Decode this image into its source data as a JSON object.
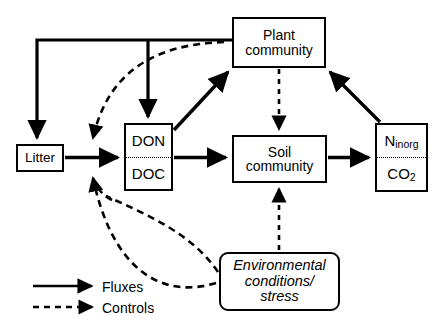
{
  "diagram": {
    "nodes": {
      "litter": {
        "label": "Litter"
      },
      "plant_community": {
        "line1": "Plant",
        "line2": "community"
      },
      "dom": {
        "top": "DON",
        "bottom": "DOC"
      },
      "soil_community": {
        "line1": "Soil",
        "line2": "community"
      },
      "inorganic": {
        "top_main": "N",
        "top_sub": "inorg",
        "bottom_main": "CO",
        "bottom_sub": "2"
      },
      "environment": {
        "line1": "Environmental",
        "line2": "conditions/",
        "line3": "stress"
      }
    },
    "legend": {
      "fluxes_label": "Fluxes",
      "controls_label": "Controls"
    },
    "colors": {
      "stroke": "#000000",
      "background": "#ffffff"
    },
    "edges": [
      {
        "from": "plant_community",
        "to": "litter",
        "type": "flux"
      },
      {
        "from": "plant_community",
        "to": "dom",
        "type": "flux"
      },
      {
        "from": "litter",
        "to": "dom",
        "type": "flux"
      },
      {
        "from": "dom",
        "to": "plant_community",
        "type": "flux"
      },
      {
        "from": "dom",
        "to": "soil_community",
        "type": "flux"
      },
      {
        "from": "soil_community",
        "to": "inorganic",
        "type": "flux"
      },
      {
        "from": "inorganic",
        "to": "plant_community",
        "type": "flux"
      },
      {
        "from": "plant_community",
        "to": "soil_community",
        "type": "control"
      },
      {
        "from": "environment",
        "to": "soil_community",
        "type": "control"
      },
      {
        "from": "environment",
        "to": "dom",
        "type": "control"
      },
      {
        "from": "environment",
        "to": "litter_to_dom_flux",
        "type": "control"
      },
      {
        "from": "plant_community",
        "to": "litter_to_dom_flux",
        "type": "control"
      }
    ]
  }
}
